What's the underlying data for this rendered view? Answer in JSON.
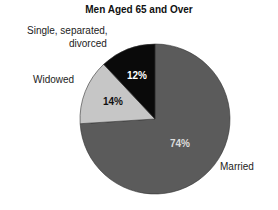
{
  "chart_data": {
    "type": "pie",
    "title": "Men Aged 65 and Over",
    "categories": [
      "Married",
      "Widowed",
      "Single, separated, divorced"
    ],
    "values": [
      74,
      14,
      12
    ],
    "value_labels": [
      "74%",
      "14%",
      "12%"
    ],
    "colors": [
      "#5b5b5b",
      "#c6c6c6",
      "#0a0a0a"
    ],
    "start_angle_deg": 0,
    "direction": "clockwise",
    "legend": "none (direct labels)"
  },
  "labels": {
    "single_line1": "Single, separated,",
    "single_line2": "divorced",
    "widowed": "Widowed",
    "married": "Married"
  }
}
